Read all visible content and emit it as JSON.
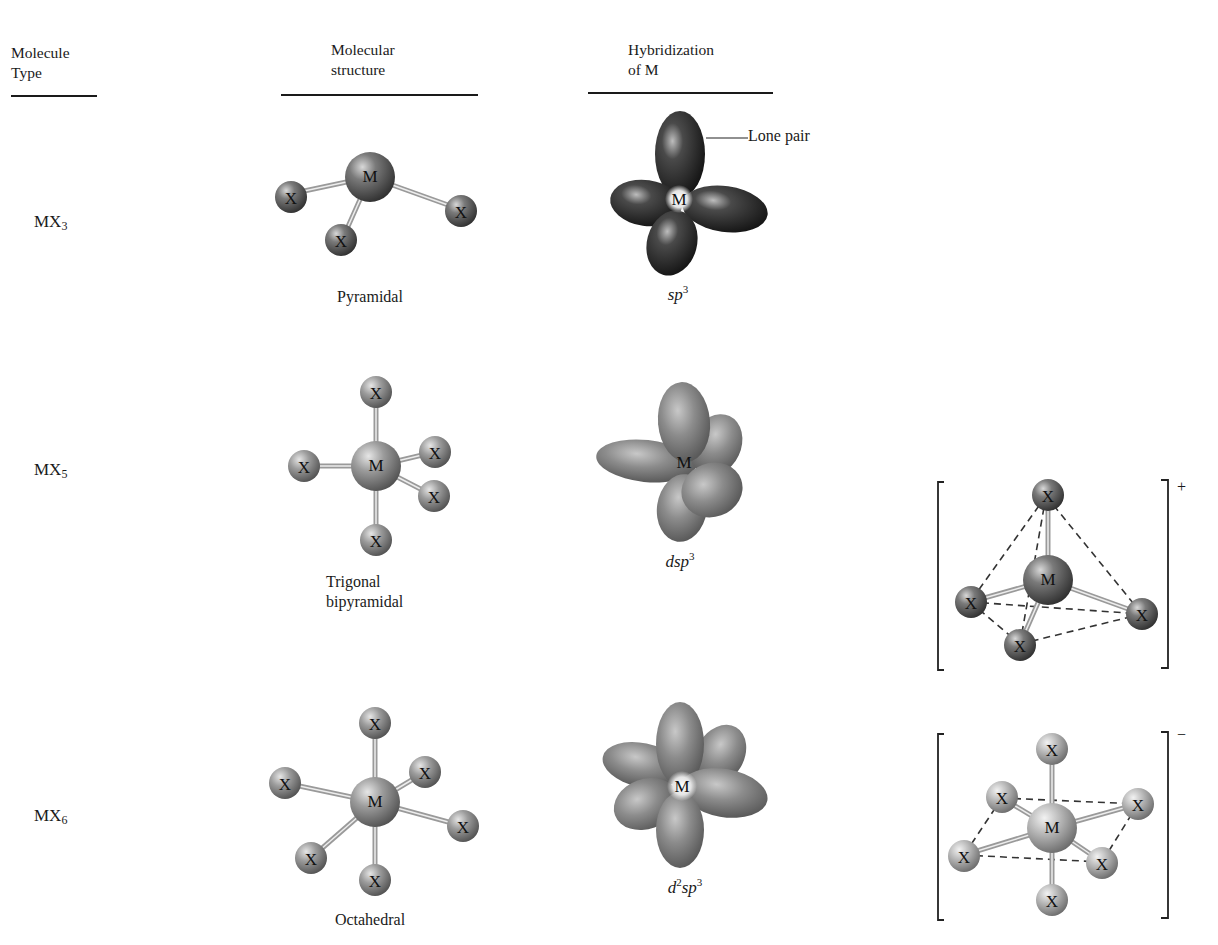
{
  "headers": {
    "molecule_type": [
      "Molecule",
      "Type"
    ],
    "molecular_structure": [
      "Molecular",
      "structure"
    ],
    "hybridization": [
      "Hybridization",
      "of M"
    ]
  },
  "rows": [
    {
      "type": {
        "base": "MX",
        "sub": "3"
      },
      "structure_caption": [
        "Pyramidal"
      ],
      "hybridization": {
        "parts": [
          {
            "t": "sp",
            "sup": "3"
          }
        ]
      },
      "annotation": "Lone pair",
      "center_atom": "M",
      "ligand_atom": "X",
      "ligand_count": 3
    },
    {
      "type": {
        "base": "MX",
        "sub": "5"
      },
      "structure_caption": [
        "Trigonal",
        "bipyramidal"
      ],
      "hybridization": {
        "parts": [
          {
            "t": "dsp",
            "sup": "3"
          }
        ]
      },
      "center_atom": "M",
      "ligand_atom": "X",
      "ligand_count": 5,
      "ion": {
        "charge": "+",
        "geometry": "tetrahedral",
        "ligand_count": 4
      }
    },
    {
      "type": {
        "base": "MX",
        "sub": "6"
      },
      "structure_caption": [
        "Octahedral"
      ],
      "hybridization": {
        "parts": [
          {
            "t": "d",
            "sup": "2"
          },
          {
            "t": "sp",
            "sup": "3"
          }
        ]
      },
      "center_atom": "M",
      "ligand_atom": "X",
      "ligand_count": 6,
      "ion": {
        "charge": "−",
        "geometry": "octahedral",
        "ligand_count": 6
      }
    }
  ],
  "labels": {
    "M": "M",
    "X": "X"
  },
  "colors": {
    "dark_lobe": "#3a3a3a",
    "light_lobe": "#8a8a8a",
    "atom_dark": "#5a5a5a",
    "atom_light": "#9a9a9a",
    "text": "#1a1a1a"
  }
}
